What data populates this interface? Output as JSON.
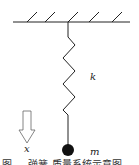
{
  "diagram": {
    "type": "spring-mass system",
    "ceiling": {
      "hatch_count": 5
    },
    "spring": {
      "label": "k"
    },
    "mass": {
      "label": "m"
    },
    "direction_arrow": {
      "label": "x",
      "direction": "down"
    },
    "caption": "图 — 弹簧-质量系统示意图"
  },
  "colors": {
    "stroke": "#222222",
    "background": "#ffffff"
  }
}
